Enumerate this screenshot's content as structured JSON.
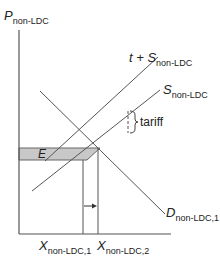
{
  "diagram": {
    "type": "supply-demand with tariff",
    "y_axis": {
      "symbol": "P",
      "subscript": "non-LDC"
    },
    "x_axis": {
      "ticks": [
        {
          "symbol": "X",
          "subscript": "non-LDC,1"
        },
        {
          "symbol": "X",
          "subscript": "non-LDC,2"
        }
      ]
    },
    "curves": {
      "tariff_supply": {
        "prefix": "t + ",
        "symbol": "S",
        "subscript": "non-LDC"
      },
      "supply": {
        "symbol": "S",
        "subscript": "non-LDC"
      },
      "demand": {
        "symbol": "D",
        "subscript": "non-LDC,1"
      }
    },
    "annotations": {
      "tariff_label": "tariff",
      "shaded_area_label": "E"
    },
    "colors": {
      "lines": "#555555",
      "shaded_area": "#c8c8c8",
      "shaded_border": "#666666"
    }
  }
}
